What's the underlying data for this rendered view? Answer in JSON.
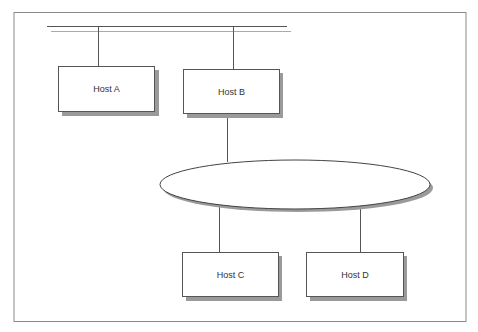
{
  "diagram": {
    "hosts": [
      {
        "id": "host-a",
        "label": "Host A"
      },
      {
        "id": "host-b",
        "label": "Host B"
      },
      {
        "id": "host-c",
        "label": "Host C"
      },
      {
        "id": "host-d",
        "label": "Host D"
      }
    ],
    "network": {
      "shape": "ellipse",
      "label": ""
    },
    "bus": {
      "label": ""
    },
    "colors": {
      "stroke": "#555555",
      "shadow": "#9a9a9a",
      "fill": "#ffffff",
      "frame": "#8a8a8a"
    }
  }
}
